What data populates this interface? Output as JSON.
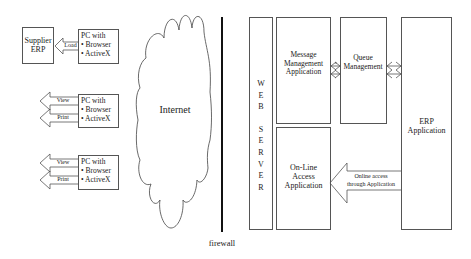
{
  "diagram": {
    "supplier_erp": {
      "line1": "Supplier",
      "line2": "ERP"
    },
    "load_arrow": {
      "label": "Load"
    },
    "pc_clients": [
      {
        "title": "PC with",
        "items": [
          "• Browser",
          "• ActiveX"
        ],
        "arrows": [
          "Load"
        ]
      },
      {
        "title": "PC with",
        "items": [
          "• Browser",
          "• ActiveX"
        ],
        "arrows": [
          "View",
          "Print"
        ]
      },
      {
        "title": "PC with",
        "items": [
          "• Browser",
          "• ActiveX"
        ],
        "arrows": [
          "View",
          "Print"
        ]
      }
    ],
    "internet": {
      "label": "Internet"
    },
    "firewall": {
      "label": "firewall"
    },
    "web_server": {
      "letters": [
        "W",
        "E",
        "B",
        "",
        "S",
        "E",
        "R",
        "V",
        "E",
        "R"
      ]
    },
    "message_management": {
      "line1": "Message",
      "line2": "Management",
      "line3": "Application"
    },
    "queue_management": {
      "line1": "Queue",
      "line2": "Management"
    },
    "online_access": {
      "line1": "On-Line",
      "line2": "Access",
      "line3": "Application"
    },
    "erp_application": {
      "line1": "ERP",
      "line2": "Application"
    },
    "online_arrow": {
      "line1": "Online access",
      "line2": "through Application"
    },
    "colors": {
      "stroke": "#555555",
      "firewall": "#111111",
      "background": "#ffffff"
    }
  }
}
